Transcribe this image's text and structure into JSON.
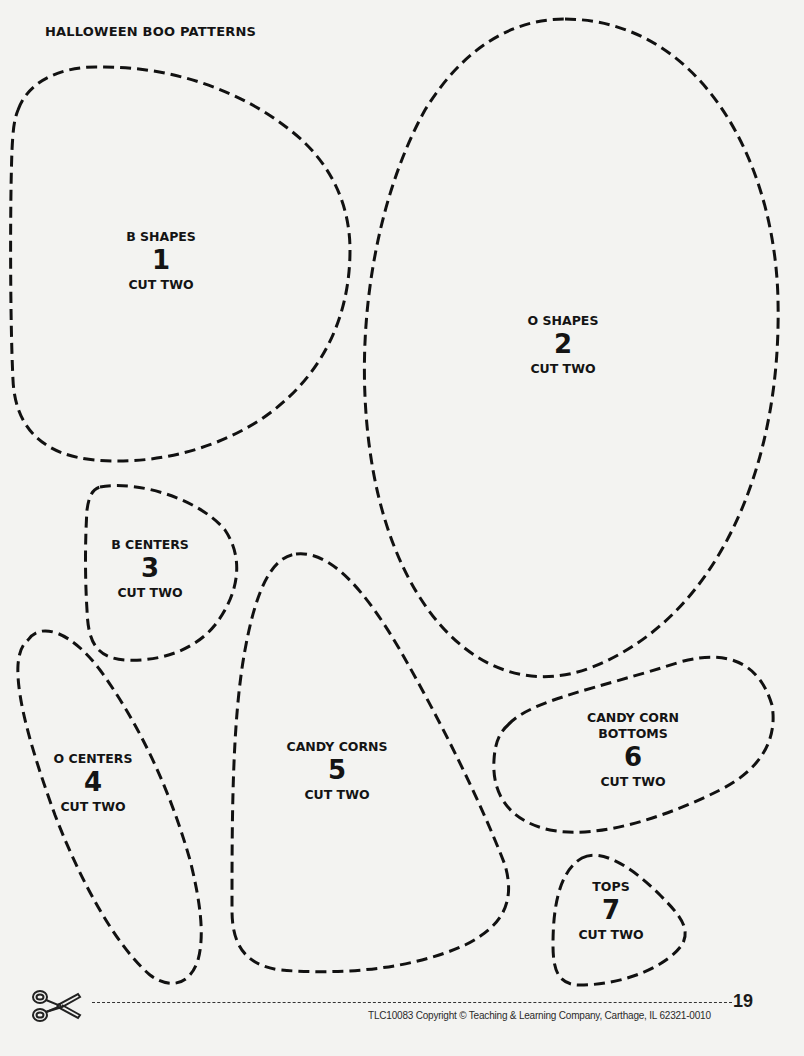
{
  "page": {
    "title": "Halloween Boo Patterns",
    "background_color": "#f3f3f1",
    "line_color": "#111111"
  },
  "patterns": [
    {
      "id": 1,
      "name": "B SHAPES",
      "number": "1",
      "instruction": "CUT TWO"
    },
    {
      "id": 2,
      "name": "O SHAPES",
      "number": "2",
      "instruction": "CUT TWO"
    },
    {
      "id": 3,
      "name": "B CENTERS",
      "number": "3",
      "instruction": "CUT TWO"
    },
    {
      "id": 4,
      "name": "O CENTERS",
      "number": "4",
      "instruction": "CUT TWO"
    },
    {
      "id": 5,
      "name": "CANDY CORNS",
      "number": "5",
      "instruction": "CUT TWO"
    },
    {
      "id": 6,
      "name_line1": "CANDY CORN",
      "name_line2": "BOTTOMS",
      "number": "6",
      "instruction": "CUT TWO"
    },
    {
      "id": 7,
      "name": "TOPS",
      "number": "7",
      "instruction": "CUT TWO"
    }
  ],
  "footer": {
    "icon": "scissors-icon",
    "page_number": "19",
    "copyright": "TLC10083 Copyright © Teaching & Learning Company, Carthage, IL  62321-0010"
  }
}
